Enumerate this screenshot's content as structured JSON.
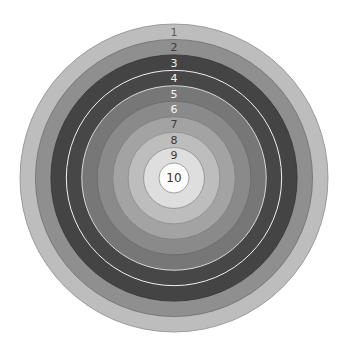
{
  "diagram": {
    "type": "target",
    "rings": [
      {
        "score": "1",
        "fill": "#bdbdbd",
        "label_color": "#5a5a5a",
        "edge_color": "#8c8c8c"
      },
      {
        "score": "2",
        "fill": "#8f8f8f",
        "label_color": "#3c3c3c",
        "edge_color": "#6e6e6e"
      },
      {
        "score": "3",
        "fill": "#444444",
        "label_color": "#f2f2f2",
        "edge_color": "#333333"
      },
      {
        "score": "4",
        "fill": "#474747",
        "label_color": "#f2f2f2",
        "edge_color": "#f0f0f0"
      },
      {
        "score": "5",
        "fill": "#777777",
        "label_color": "#f4f4f4",
        "edge_color": "#d8d8d8"
      },
      {
        "score": "6",
        "fill": "#8a8a8a",
        "label_color": "#f4f4f4",
        "edge_color": "#6a6a6a"
      },
      {
        "score": "7",
        "fill": "#a3a3a3",
        "label_color": "#3a3a3a",
        "edge_color": "#7c7c7c"
      },
      {
        "score": "8",
        "fill": "#bdbdbd",
        "label_color": "#3a3a3a",
        "edge_color": "#8c8c8c"
      },
      {
        "score": "9",
        "fill": "#dedede",
        "label_color": "#3a3a3a",
        "edge_color": "#8c8c8c"
      },
      {
        "score": "10",
        "fill": "#fbfbfb",
        "label_color": "#333333",
        "edge_color": "#8c8c8c"
      }
    ]
  }
}
